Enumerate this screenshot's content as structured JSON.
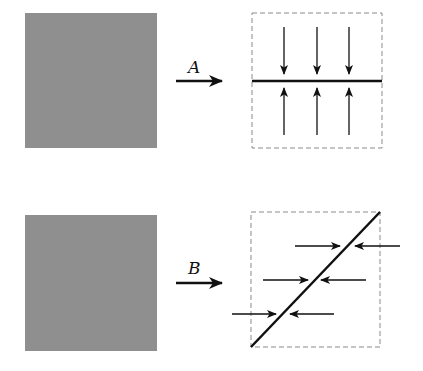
{
  "diagram": {
    "colors": {
      "square_fill": "#8f8f8f",
      "line": "#111111",
      "dashed": "#8a8a8a"
    },
    "transforms": [
      {
        "label": "A",
        "description": "gray square maps to dashed box with horizontal line; vertical arrows compress toward line from above and below"
      },
      {
        "label": "B",
        "description": "gray square maps to dashed box with diagonal line; horizontal arrows compress toward line from left and right"
      }
    ]
  }
}
